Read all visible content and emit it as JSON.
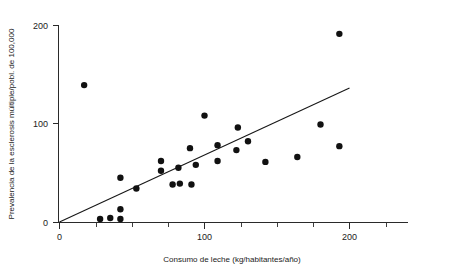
{
  "chart_data": {
    "type": "scatter",
    "title": "",
    "xlabel": "Consumo de leche (kg/habitantes/año)",
    "ylabel": "Prevalencia de la esclerosis múltiple/pobl. de 100,000",
    "xlim": [
      0,
      215
    ],
    "ylim": [
      0,
      205
    ],
    "grid": false,
    "legend": null,
    "x_ticks_major": [
      0,
      100,
      200
    ],
    "x_tick_labels_major": [
      "0",
      "100",
      "200"
    ],
    "x_ticks_minor": [
      25,
      50,
      75,
      125,
      150,
      175
    ],
    "y_ticks_major": [
      0,
      100,
      200
    ],
    "y_tick_labels_major": [
      "0",
      "100",
      "200"
    ],
    "points": [
      {
        "x": 17,
        "y": 139
      },
      {
        "x": 28,
        "y": 3
      },
      {
        "x": 35,
        "y": 4
      },
      {
        "x": 42,
        "y": 3
      },
      {
        "x": 42,
        "y": 13
      },
      {
        "x": 42,
        "y": 45
      },
      {
        "x": 53,
        "y": 34
      },
      {
        "x": 70,
        "y": 52
      },
      {
        "x": 70,
        "y": 62
      },
      {
        "x": 78,
        "y": 38
      },
      {
        "x": 83,
        "y": 39
      },
      {
        "x": 82,
        "y": 55
      },
      {
        "x": 91,
        "y": 38
      },
      {
        "x": 90,
        "y": 75
      },
      {
        "x": 94,
        "y": 58
      },
      {
        "x": 100,
        "y": 108
      },
      {
        "x": 109,
        "y": 62
      },
      {
        "x": 109,
        "y": 78
      },
      {
        "x": 122,
        "y": 73
      },
      {
        "x": 123,
        "y": 96
      },
      {
        "x": 130,
        "y": 82
      },
      {
        "x": 142,
        "y": 61
      },
      {
        "x": 164,
        "y": 66
      },
      {
        "x": 180,
        "y": 99
      },
      {
        "x": 193,
        "y": 77
      },
      {
        "x": 193,
        "y": 191
      }
    ],
    "trend_line": {
      "type": "linear-fit",
      "x_start": 0,
      "y_start": 0,
      "x_end": 200,
      "y_end": 136
    }
  },
  "axes": {
    "y_label_text": "Prevalencia de la esclerosis múltiple/pobl. de 100,000",
    "x_label_text": "Consumo de leche (kg/habitantes/año)",
    "y_tick_0": "0",
    "y_tick_100": "100",
    "y_tick_200": "200",
    "x_tick_0": "0",
    "x_tick_100": "100",
    "x_tick_200": "200"
  },
  "colors": {
    "point": "#111111",
    "line": "#171717",
    "axis": "#2a2a2a",
    "background": "#ffffff",
    "text": "#1a1a1a"
  }
}
